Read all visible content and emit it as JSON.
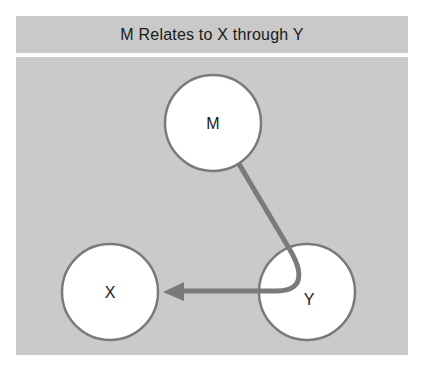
{
  "title": "M Relates to X through Y",
  "nodes": [
    {
      "id": "M",
      "label": "M",
      "cx": 213,
      "cy": 123,
      "r": 48
    },
    {
      "id": "X",
      "label": "X",
      "cx": 110,
      "cy": 292,
      "r": 48
    },
    {
      "id": "Y",
      "label": "Y",
      "cx": 307,
      "cy": 292,
      "r": 48
    }
  ],
  "edges": [
    {
      "from": "M",
      "to": "X",
      "via": "Y",
      "directed": true
    }
  ],
  "colors": {
    "background": "#ffffff",
    "panel": "#cacaca",
    "node_fill": "#ffffff",
    "node_stroke": "#7a7a7a",
    "edge": "#7a7a7a"
  }
}
